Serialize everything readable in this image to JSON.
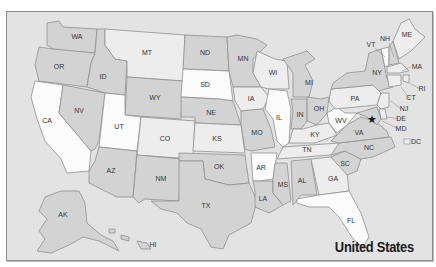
{
  "map": {
    "title": "United States",
    "colors": {
      "background": "#e3e3e3",
      "white": "#fbfbfb",
      "light": "#ededed",
      "medium": "#d3d3d3",
      "border": "#8f8f8f",
      "star": "#1a1a1a"
    },
    "capital_marker": "star-icon",
    "states": [
      {
        "abbr": "WA",
        "shade": "medium"
      },
      {
        "abbr": "OR",
        "shade": "medium"
      },
      {
        "abbr": "CA",
        "shade": "white"
      },
      {
        "abbr": "NV",
        "shade": "medium"
      },
      {
        "abbr": "ID",
        "shade": "medium"
      },
      {
        "abbr": "MT",
        "shade": "light"
      },
      {
        "abbr": "WY",
        "shade": "medium"
      },
      {
        "abbr": "UT",
        "shade": "white"
      },
      {
        "abbr": "CO",
        "shade": "light"
      },
      {
        "abbr": "AZ",
        "shade": "medium"
      },
      {
        "abbr": "NM",
        "shade": "medium"
      },
      {
        "abbr": "ND",
        "shade": "medium"
      },
      {
        "abbr": "SD",
        "shade": "white"
      },
      {
        "abbr": "NE",
        "shade": "medium"
      },
      {
        "abbr": "KS",
        "shade": "light"
      },
      {
        "abbr": "OK",
        "shade": "medium"
      },
      {
        "abbr": "TX",
        "shade": "medium"
      },
      {
        "abbr": "MN",
        "shade": "medium"
      },
      {
        "abbr": "IA",
        "shade": "light"
      },
      {
        "abbr": "MO",
        "shade": "medium"
      },
      {
        "abbr": "AR",
        "shade": "white"
      },
      {
        "abbr": "LA",
        "shade": "medium"
      },
      {
        "abbr": "WI",
        "shade": "light"
      },
      {
        "abbr": "IL",
        "shade": "white"
      },
      {
        "abbr": "MS",
        "shade": "medium"
      },
      {
        "abbr": "MI",
        "shade": "medium"
      },
      {
        "abbr": "IN",
        "shade": "medium"
      },
      {
        "abbr": "OH",
        "shade": "medium"
      },
      {
        "abbr": "KY",
        "shade": "light"
      },
      {
        "abbr": "TN",
        "shade": "light"
      },
      {
        "abbr": "AL",
        "shade": "medium"
      },
      {
        "abbr": "GA",
        "shade": "light"
      },
      {
        "abbr": "FL",
        "shade": "white"
      },
      {
        "abbr": "SC",
        "shade": "medium"
      },
      {
        "abbr": "NC",
        "shade": "medium"
      },
      {
        "abbr": "VA",
        "shade": "medium"
      },
      {
        "abbr": "WV",
        "shade": "white"
      },
      {
        "abbr": "PA",
        "shade": "light"
      },
      {
        "abbr": "NY",
        "shade": "medium"
      },
      {
        "abbr": "VT",
        "shade": "white"
      },
      {
        "abbr": "NH",
        "shade": "medium"
      },
      {
        "abbr": "ME",
        "shade": "light"
      },
      {
        "abbr": "MA",
        "shade": "light"
      },
      {
        "abbr": "RI",
        "shade": "light"
      },
      {
        "abbr": "CT",
        "shade": "light"
      },
      {
        "abbr": "NJ",
        "shade": "light"
      },
      {
        "abbr": "DE",
        "shade": "light"
      },
      {
        "abbr": "MD",
        "shade": "medium"
      },
      {
        "abbr": "DC",
        "shade": "light"
      },
      {
        "abbr": "AK",
        "shade": "medium"
      },
      {
        "abbr": "HI",
        "shade": "medium"
      }
    ]
  }
}
